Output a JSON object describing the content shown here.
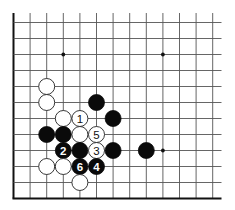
{
  "diagram": {
    "board": {
      "columns": 13,
      "rows": 12,
      "origin_x": 13.5,
      "origin_y": 22.5,
      "spacing_x": 16.6,
      "spacing_y": 16.0,
      "line_top": 13,
      "line_right": 221.5,
      "left_edge": true,
      "bottom_edge": true,
      "star_points": [
        {
          "col": 3,
          "row": 2
        },
        {
          "col": 9,
          "row": 2
        },
        {
          "col": 9,
          "row": 8
        }
      ]
    },
    "stone_radius": 8,
    "colors": {
      "black_stone": "#0a0a0a",
      "white_stone": "#ffffff",
      "grid": "#555555",
      "edge": "#111111"
    },
    "stones": [
      {
        "color": "white",
        "col": 2,
        "row": 4,
        "label": ""
      },
      {
        "color": "white",
        "col": 2,
        "row": 5,
        "label": ""
      },
      {
        "color": "black",
        "col": 5,
        "row": 5,
        "label": ""
      },
      {
        "color": "white",
        "col": 3,
        "row": 6,
        "label": ""
      },
      {
        "color": "white",
        "col": 4,
        "row": 6,
        "label": "1"
      },
      {
        "color": "black",
        "col": 6,
        "row": 6,
        "label": ""
      },
      {
        "color": "black",
        "col": 2,
        "row": 7,
        "label": ""
      },
      {
        "color": "black",
        "col": 3,
        "row": 7,
        "label": ""
      },
      {
        "color": "white",
        "col": 4,
        "row": 7,
        "label": ""
      },
      {
        "color": "white",
        "col": 5,
        "row": 7,
        "label": "5"
      },
      {
        "color": "black",
        "col": 3,
        "row": 8,
        "label": "2"
      },
      {
        "color": "black",
        "col": 4,
        "row": 8,
        "label": ""
      },
      {
        "color": "white",
        "col": 5,
        "row": 8,
        "label": "3"
      },
      {
        "color": "black",
        "col": 6,
        "row": 8,
        "label": ""
      },
      {
        "color": "black",
        "col": 8,
        "row": 8,
        "label": ""
      },
      {
        "color": "white",
        "col": 2,
        "row": 9,
        "label": ""
      },
      {
        "color": "white",
        "col": 3,
        "row": 9,
        "label": ""
      },
      {
        "color": "black",
        "col": 4,
        "row": 9,
        "label": "6"
      },
      {
        "color": "black",
        "col": 5,
        "row": 9,
        "label": "4"
      },
      {
        "color": "white",
        "col": 4,
        "row": 10,
        "label": ""
      }
    ],
    "move_sequence": [
      {
        "move": "1",
        "color": "white"
      },
      {
        "move": "2",
        "color": "black"
      },
      {
        "move": "3",
        "color": "white"
      },
      {
        "move": "4",
        "color": "black"
      },
      {
        "move": "5",
        "color": "white"
      },
      {
        "move": "6",
        "color": "black"
      }
    ]
  }
}
